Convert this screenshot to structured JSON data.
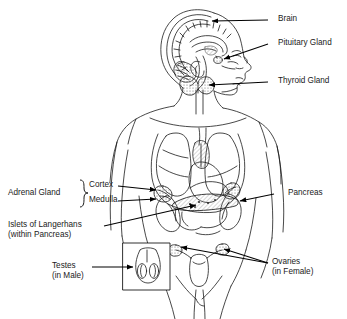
{
  "diagram": {
    "background_color": "#ffffff",
    "line_color": "#1a1a1a",
    "arrow_color": "#000000"
  },
  "labels": {
    "brain": "Brain",
    "pituitary": "Pituitary Gland",
    "thyroid": "Thyroid Gland",
    "pancreas": "Pancreas",
    "adrenal_gland": "Adrenal Gland",
    "cortex": "Cortex",
    "medulla": "Medulla",
    "islets_line1": "Islets of Langerhans",
    "islets_line2": "(within Pancreas)",
    "testes_line1": "Testes",
    "testes_line2": "(in Male)",
    "ovaries_line1": "Ovaries",
    "ovaries_line2": "(in Female)"
  }
}
